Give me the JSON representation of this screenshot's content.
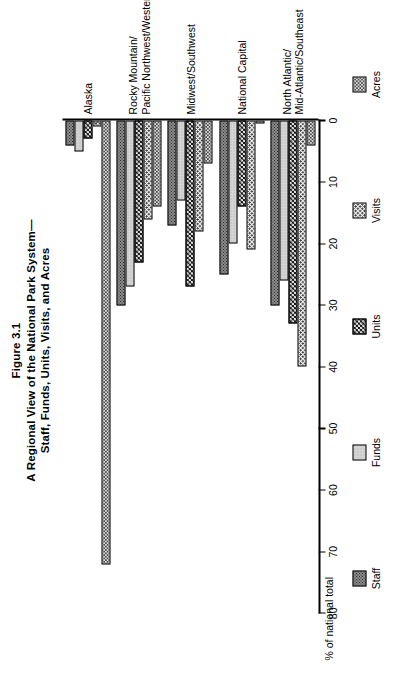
{
  "figure": {
    "number": "Figure 3.1",
    "title_line1": "A Regional View of the National Park System—",
    "title_line2": "Staff, Funds, Units, Visits, and Acres"
  },
  "chart_data": {
    "type": "bar",
    "orientation": "horizontal",
    "xlabel": "",
    "ylabel": "% of national total",
    "axis_title": "% of national total",
    "ylim": [
      0,
      80
    ],
    "tick_labels": [
      "0",
      "10",
      "20",
      "30",
      "40",
      "50",
      "60",
      "70",
      "80"
    ],
    "tick_values": [
      0,
      10,
      20,
      30,
      40,
      50,
      60,
      70,
      80
    ],
    "grid": false,
    "legend_position": "bottom",
    "categories": [
      "North Atlantic/\nMid-Atlantic/Southeast",
      "National Capital",
      "Midwest/Southwest",
      "Rocky Mountain/\nPacific Northwest/Western",
      "Alaska"
    ],
    "series": [
      {
        "name": "Staff",
        "pattern": "dark-dotted",
        "values": [
          30,
          25,
          17,
          30,
          4
        ]
      },
      {
        "name": "Funds",
        "pattern": "light-gray",
        "values": [
          26,
          20,
          13,
          27,
          5
        ]
      },
      {
        "name": "Units",
        "pattern": "dark-checkerboard",
        "values": [
          33,
          14,
          27,
          23,
          3
        ]
      },
      {
        "name": "Visits",
        "pattern": "light-dotted",
        "values": [
          40,
          21,
          18,
          16,
          1
        ]
      },
      {
        "name": "Acres",
        "pattern": "medium-dotted",
        "values": [
          4,
          0.5,
          7,
          14,
          72
        ]
      }
    ]
  },
  "legend": {
    "items": [
      {
        "label": "Staff"
      },
      {
        "label": "Funds"
      },
      {
        "label": "Units"
      },
      {
        "label": "Visits"
      },
      {
        "label": "Acres"
      }
    ]
  }
}
